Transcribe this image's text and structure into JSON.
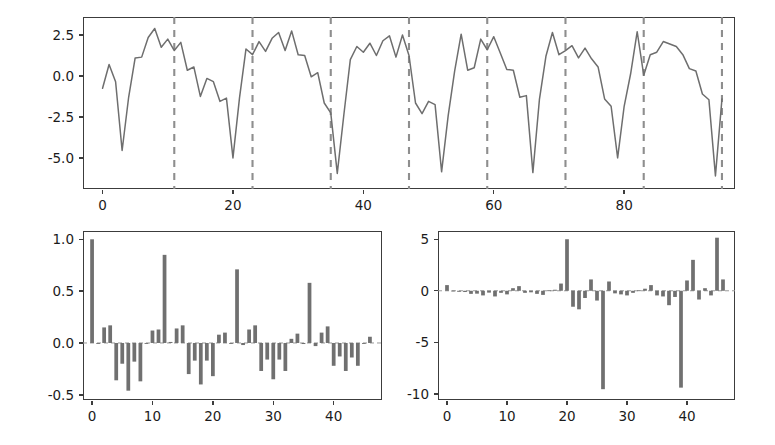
{
  "figure": {
    "background": "#ffffff",
    "line_color": "#6e6e6e",
    "bar_color": "#707070",
    "separator_color": "#8e8e8e",
    "axis_color": "#3c3c3c"
  },
  "chart_data": [
    {
      "id": "series-plot",
      "type": "line",
      "title": "",
      "xlabel": "",
      "ylabel": "",
      "xlim": [
        -3,
        97
      ],
      "ylim": [
        -6.9,
        3.6
      ],
      "xticks": [
        0,
        20,
        40,
        60,
        80
      ],
      "xticklabels": [
        "0",
        "20",
        "40",
        "60",
        "80"
      ],
      "yticks": [
        2.5,
        0.0,
        -2.5,
        -5.0
      ],
      "yticklabels": [
        "2.5",
        "0.0",
        "-2.5",
        "-5.0"
      ],
      "grid": false,
      "legend": null,
      "annotations": {
        "vertical_dashed_lines_x": [
          11,
          23,
          35,
          47,
          59,
          71,
          83,
          95
        ],
        "note": "seasonal period boundaries, period = 12"
      },
      "x": [
        0,
        1,
        2,
        3,
        4,
        5,
        6,
        7,
        8,
        9,
        10,
        11,
        12,
        13,
        14,
        15,
        16,
        17,
        18,
        19,
        20,
        21,
        22,
        23,
        24,
        25,
        26,
        27,
        28,
        29,
        30,
        31,
        32,
        33,
        34,
        35,
        36,
        37,
        38,
        39,
        40,
        41,
        42,
        43,
        44,
        45,
        46,
        47,
        48,
        49,
        50,
        51,
        52,
        53,
        54,
        55,
        56,
        57,
        58,
        59,
        60,
        61,
        62,
        63,
        64,
        65,
        66,
        67,
        68,
        69,
        70,
        71,
        72,
        73,
        74,
        75,
        76,
        77,
        78,
        79,
        80,
        81,
        82,
        83,
        84,
        85,
        86,
        87,
        88,
        89,
        90,
        91,
        92,
        93,
        94,
        95
      ],
      "y": [
        -0.75,
        0.7,
        -0.35,
        -4.55,
        -1.3,
        1.1,
        1.15,
        2.35,
        2.9,
        1.75,
        2.25,
        1.55,
        2.05,
        0.35,
        0.55,
        -1.25,
        -0.15,
        -0.35,
        -1.55,
        -1.35,
        -5.0,
        -1.35,
        1.65,
        1.3,
        2.1,
        1.5,
        2.3,
        2.65,
        1.55,
        2.75,
        1.3,
        1.25,
        -0.05,
        0.2,
        -1.65,
        -2.25,
        -5.95,
        -2.4,
        1.0,
        1.8,
        1.45,
        2.0,
        1.25,
        2.15,
        2.45,
        1.15,
        2.5,
        1.25,
        -1.65,
        -2.3,
        -1.55,
        -1.75,
        -5.85,
        -2.45,
        0.3,
        2.55,
        0.35,
        0.5,
        2.25,
        1.6,
        2.4,
        1.4,
        0.4,
        0.35,
        -1.3,
        -1.2,
        -5.9,
        -1.45,
        1.2,
        2.65,
        1.3,
        1.55,
        1.85,
        1.1,
        1.7,
        1.05,
        0.55,
        -1.4,
        -1.85,
        -5.0,
        -1.85,
        0.15,
        2.7,
        0.05,
        1.3,
        1.45,
        2.1,
        1.95,
        1.8,
        1.3,
        0.45,
        0.3,
        -1.1,
        -1.45,
        -6.1,
        -1.4,
        0.0,
        2.85,
        -0.05,
        0.3,
        3.15,
        0.9,
        1.2,
        2.25,
        0.8,
        1.0,
        2.25,
        1.35,
        -1.0,
        -1.3,
        -2.2,
        -6.3,
        -1.3,
        0.45,
        3.3,
        0.4,
        0.65,
        3.3,
        1.15,
        1.4,
        1.5,
        1.0,
        1.85,
        3.1
      ]
    },
    {
      "id": "acf-plot",
      "type": "bar",
      "title": "",
      "xlabel": "",
      "ylabel": "",
      "xlim": [
        -1.5,
        48
      ],
      "ylim": [
        -0.55,
        1.08
      ],
      "xticks": [
        0,
        10,
        20,
        30,
        40
      ],
      "xticklabels": [
        "0",
        "10",
        "20",
        "30",
        "40"
      ],
      "yticks": [
        1.0,
        0.5,
        0.0,
        -0.5
      ],
      "yticklabels": [
        "1.0",
        "0.5",
        "0.0",
        "-0.5"
      ],
      "grid": false,
      "legend": null,
      "lags": [
        0,
        1,
        2,
        3,
        4,
        5,
        6,
        7,
        8,
        9,
        10,
        11,
        12,
        13,
        14,
        15,
        16,
        17,
        18,
        19,
        20,
        21,
        22,
        23,
        24,
        25,
        26,
        27,
        28,
        29,
        30,
        31,
        32,
        33,
        34,
        35,
        36,
        37,
        38,
        39,
        40,
        41,
        42,
        43,
        44,
        45,
        46
      ],
      "values": [
        1.0,
        0.0,
        0.15,
        0.17,
        -0.36,
        -0.2,
        -0.46,
        -0.18,
        -0.37,
        0.0,
        0.12,
        0.13,
        0.85,
        0.01,
        0.14,
        0.17,
        -0.3,
        -0.17,
        -0.4,
        -0.17,
        -0.32,
        0.08,
        0.1,
        0.0,
        0.71,
        -0.02,
        0.13,
        0.17,
        -0.27,
        -0.16,
        -0.35,
        -0.16,
        -0.27,
        0.04,
        0.09,
        -0.01,
        0.58,
        -0.03,
        0.1,
        0.16,
        -0.22,
        -0.13,
        -0.27,
        -0.14,
        -0.22,
        0.0,
        0.06
      ]
    },
    {
      "id": "pacf-plot",
      "type": "bar",
      "title": "",
      "xlabel": "",
      "ylabel": "",
      "xlim": [
        -1.5,
        48
      ],
      "ylim": [
        -10.6,
        5.8
      ],
      "xticks": [
        0,
        10,
        20,
        30,
        40
      ],
      "xticklabels": [
        "0",
        "10",
        "20",
        "30",
        "40"
      ],
      "yticks": [
        5,
        0,
        -5,
        -10
      ],
      "yticklabels": [
        "5",
        "0",
        "-5",
        "-10"
      ],
      "grid": false,
      "legend": null,
      "lags": [
        0,
        1,
        2,
        3,
        4,
        5,
        6,
        7,
        8,
        9,
        10,
        11,
        12,
        13,
        14,
        15,
        16,
        17,
        18,
        19,
        20,
        21,
        22,
        23,
        24,
        25,
        26,
        27,
        28,
        29,
        30,
        31,
        32,
        33,
        34,
        35,
        36,
        37,
        38,
        39,
        40,
        41,
        42,
        43,
        44,
        45,
        46
      ],
      "values": [
        0.55,
        0.02,
        -0.1,
        -0.12,
        -0.3,
        -0.28,
        -0.45,
        -0.18,
        -0.55,
        -0.2,
        -0.35,
        0.25,
        0.45,
        -0.2,
        -0.15,
        -0.3,
        -0.4,
        0.05,
        0.1,
        0.7,
        5.0,
        -1.55,
        -1.8,
        -0.7,
        1.1,
        -0.95,
        -9.55,
        0.9,
        -0.25,
        -0.35,
        -0.45,
        -0.2,
        0.05,
        0.2,
        0.55,
        -0.45,
        -0.55,
        -1.4,
        -0.6,
        -9.4,
        1.0,
        3.0,
        -0.85,
        0.25,
        -0.45,
        5.15,
        1.1
      ]
    }
  ]
}
